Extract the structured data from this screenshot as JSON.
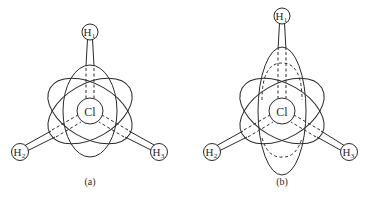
{
  "figure": {
    "panels": [
      {
        "id": "a",
        "caption": "(a)",
        "center_atom": "Cl",
        "atoms": [
          {
            "name": "H",
            "sub": "1"
          },
          {
            "name": "H",
            "sub": "2"
          },
          {
            "name": "H",
            "sub": "3"
          }
        ]
      },
      {
        "id": "b",
        "caption": "(b)",
        "center_atom": "Cl",
        "atoms": [
          {
            "name": "H",
            "sub": "1"
          },
          {
            "name": "H",
            "sub": "2"
          },
          {
            "name": "H",
            "sub": "3"
          }
        ]
      }
    ],
    "colors": {
      "line": "#2a2a2a",
      "background": "#ffffff"
    }
  }
}
